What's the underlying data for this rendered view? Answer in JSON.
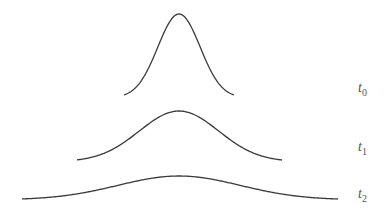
{
  "diagram": {
    "curves": [
      {
        "id": "t0",
        "label": "t",
        "subscript": "0",
        "x_start": 124,
        "x_end": 234,
        "peak_x": 179,
        "peak_y": 14,
        "base_y": 95
      },
      {
        "id": "t1",
        "label": "t",
        "subscript": "1",
        "x_start": 77,
        "x_end": 282,
        "peak_x": 179,
        "peak_y": 111,
        "base_y": 160
      },
      {
        "id": "t2",
        "label": "t",
        "subscript": "2",
        "x_start": 22,
        "x_end": 338,
        "peak_x": 179,
        "peak_y": 176,
        "base_y": 199
      }
    ],
    "stroke_color": "#3a3a3a"
  }
}
